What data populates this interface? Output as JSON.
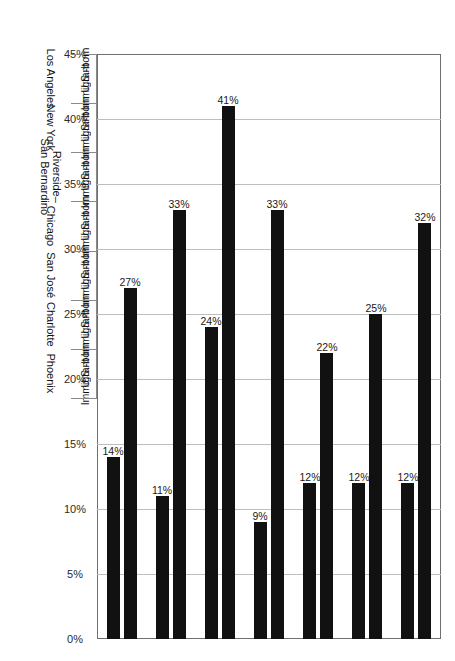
{
  "chart_data": {
    "type": "bar",
    "orientation": "horizontal",
    "title": "",
    "xlabel": "",
    "ylabel": "",
    "axis_ticks": [
      "45%",
      "40%",
      "35%",
      "30%",
      "25%",
      "20%",
      "15%",
      "10%",
      "5%",
      "0%"
    ],
    "axis_tick_values": [
      45,
      40,
      35,
      30,
      25,
      20,
      15,
      10,
      5,
      0
    ],
    "ylim": [
      0,
      45
    ],
    "grid": true,
    "legend": "none",
    "bar_color": "#111111",
    "categories": [
      "Los Angeles",
      "New York",
      "Riverside–San Bernardino",
      "Chicago",
      "San José",
      "Charlotte",
      "Phoenix"
    ],
    "subcategories": [
      "U.S.-born",
      "Immigrant"
    ],
    "series": [
      {
        "name": "U.S.-born",
        "values": [
          32,
          25,
          22,
          33,
          41,
          33,
          27
        ],
        "labels": [
          "32%",
          "25%",
          "22%",
          "33%",
          "41%",
          "33%",
          "27%"
        ]
      },
      {
        "name": "Immigrant",
        "values": [
          12,
          12,
          12,
          9,
          24,
          11,
          14
        ],
        "labels": [
          "12%",
          "12%",
          "12%",
          "9%",
          "24%",
          "11%",
          "14%"
        ]
      }
    ],
    "bars": [
      {
        "city": "Los Angeles",
        "group": "U.S.-born",
        "value": 32,
        "label": "32%"
      },
      {
        "city": "Los Angeles",
        "group": "Immigrant",
        "value": 12,
        "label": "12%"
      },
      {
        "city": "New York",
        "group": "U.S.-born",
        "value": 25,
        "label": "25%"
      },
      {
        "city": "New York",
        "group": "Immigrant",
        "value": 12,
        "label": "12%"
      },
      {
        "city": "Riverside–San Bernardino",
        "group": "U.S.-born",
        "value": 22,
        "label": "22%"
      },
      {
        "city": "Riverside–San Bernardino",
        "group": "Immigrant",
        "value": 12,
        "label": "12%"
      },
      {
        "city": "Chicago",
        "group": "U.S.-born",
        "value": 33,
        "label": "33%"
      },
      {
        "city": "Chicago",
        "group": "Immigrant",
        "value": 9,
        "label": "9%"
      },
      {
        "city": "San José",
        "group": "U.S.-born",
        "value": 41,
        "label": "41%"
      },
      {
        "city": "San José",
        "group": "Immigrant",
        "value": 24,
        "label": "24%"
      },
      {
        "city": "Charlotte",
        "group": "U.S.-born",
        "value": 33,
        "label": "33%"
      },
      {
        "city": "Charlotte",
        "group": "Immigrant",
        "value": 11,
        "label": "11%"
      },
      {
        "city": "Phoenix",
        "group": "U.S.-born",
        "value": 27,
        "label": "27%"
      },
      {
        "city": "Phoenix",
        "group": "Immigrant",
        "value": 14,
        "label": "14%"
      }
    ],
    "city_label_lines": [
      [
        "Los Angeles"
      ],
      [
        "New York"
      ],
      [
        "Riverside–",
        "San Bernardino"
      ],
      [
        "Chicago"
      ],
      [
        "San José"
      ],
      [
        "Charlotte"
      ],
      [
        "Phoenix"
      ]
    ]
  },
  "caption": {
    "text": ""
  }
}
